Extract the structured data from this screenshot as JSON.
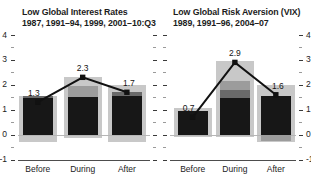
{
  "colors": {
    "bar_black": "#171717",
    "bar_dark": "#6a6a6a",
    "bar_mid": "#9c9c9c",
    "bar_range": "#c8c8c8",
    "median_line": "#111111",
    "zero_line": "#b6b6b6",
    "axis_line": "#4d4d4d",
    "tick_major": "#3a3a3a",
    "tick_minor": "#9a9a9a",
    "text": "#1c1c1c"
  },
  "y_axis": {
    "min": -1,
    "max": 4,
    "major_ticks": [
      4,
      3,
      2,
      1,
      0,
      -1
    ],
    "minor_step": 0.5
  },
  "chart_data": [
    {
      "type": "bar",
      "title": "Low Global Interest Rates",
      "subtitle": "1987, 1991–94, 1999, 2001–10:Q3",
      "categories": [
        "Before",
        "During",
        "After"
      ],
      "ylim": [
        -1,
        4
      ],
      "grid": "zero-line-only",
      "axis_label_side": "left",
      "legend": "none",
      "layers": [
        {
          "name": "range",
          "wide": true,
          "color": "bar_range",
          "values": [
            [
              -0.3,
              1.55
            ],
            [
              -0.15,
              2.3
            ],
            [
              -0.3,
              2.0
            ]
          ]
        },
        {
          "name": "black",
          "wide": false,
          "color": "bar_black",
          "values": [
            [
              0,
              1.45
            ],
            [
              0,
              1.5
            ],
            [
              0,
              1.55
            ]
          ]
        },
        {
          "name": "dark",
          "wide": false,
          "color": "bar_dark",
          "values": [
            [
              1.45,
              1.55
            ],
            null,
            [
              1.55,
              1.7
            ]
          ]
        },
        {
          "name": "mid",
          "wide": false,
          "color": "bar_mid",
          "values": [
            null,
            [
              1.5,
              1.95
            ],
            null
          ]
        }
      ],
      "median": {
        "values": [
          1.3,
          2.3,
          1.7
        ],
        "labels": [
          "1.3",
          "2.3",
          "1.7"
        ]
      }
    },
    {
      "type": "bar",
      "title": "Low Global Risk Aversion (VIX)",
      "subtitle": "1989, 1991–96, 2004–07",
      "categories": [
        "Before",
        "During",
        "After"
      ],
      "ylim": [
        -1,
        4
      ],
      "grid": "zero-line-only",
      "axis_label_side": "right",
      "legend": "none",
      "layers": [
        {
          "name": "range",
          "wide": true,
          "color": "bar_range",
          "values": [
            [
              -0.1,
              1.05
            ],
            [
              -0.1,
              2.95
            ],
            [
              -0.3,
              2.0
            ]
          ]
        },
        {
          "name": "black",
          "wide": false,
          "color": "bar_black",
          "values": [
            [
              0,
              0.95
            ],
            [
              0,
              1.45
            ],
            [
              0,
              1.55
            ]
          ]
        },
        {
          "name": "dark",
          "wide": false,
          "color": "bar_dark",
          "values": [
            null,
            [
              1.45,
              1.8
            ],
            null
          ]
        },
        {
          "name": "mid",
          "wide": false,
          "color": "bar_mid",
          "values": [
            null,
            [
              1.8,
              2.15
            ],
            [
              -0.25,
              0
            ]
          ]
        }
      ],
      "median": {
        "values": [
          0.7,
          2.9,
          1.6
        ],
        "labels": [
          "0.7",
          "2.9",
          "1.6"
        ]
      }
    }
  ]
}
